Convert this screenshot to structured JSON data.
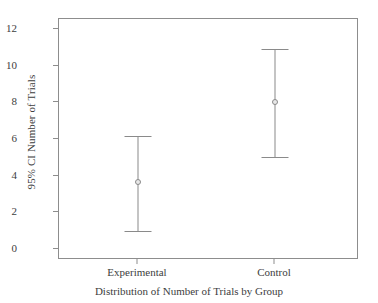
{
  "chart_data": {
    "type": "scatter",
    "title": "",
    "xlabel": "Distribution of Number of Trials by Group",
    "ylabel": "95% CI Number of Trials",
    "categories": [
      "Experimental",
      "Control"
    ],
    "values": [
      3.65,
      8.0
    ],
    "ci_lower": [
      1.0,
      5.0
    ],
    "ci_upper": [
      6.15,
      10.9
    ],
    "ylim": [
      0,
      12
    ],
    "yticks": [
      0,
      2,
      4,
      6,
      8,
      10,
      12
    ],
    "ytick_labels": [
      "0",
      "2",
      "4",
      "6",
      "8",
      "10",
      "12"
    ],
    "grid": false,
    "legend": "none",
    "series": [
      {
        "name": "95% CI Number of Trials",
        "points": [
          {
            "category": "Experimental",
            "mean": 3.65,
            "lower": 1.0,
            "upper": 6.15
          },
          {
            "category": "Control",
            "mean": 8.0,
            "lower": 5.0,
            "upper": 10.9
          }
        ]
      }
    ],
    "colors": {
      "line": "#8a8a8a",
      "frame": "#8d8d8d",
      "marker_fill": "#e8e8e8",
      "text": "#3d3d3d",
      "background": "#ffffff"
    }
  }
}
